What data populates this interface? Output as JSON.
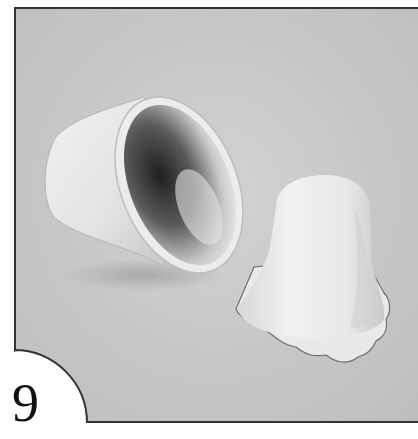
{
  "figure": {
    "step_number": "9",
    "photo": {
      "description": "Two white plastic bell-shaped molds on a gray surface: one lying on its side showing the hollow interior, one standing upright draped with a thin layer of rolled white fondant/gum paste with a scalloped ruffled edge",
      "background_color": "#c9c9c9",
      "frame_border_color": "#333333"
    }
  }
}
